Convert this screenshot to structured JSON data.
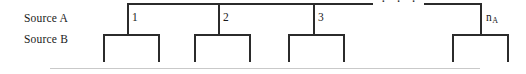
{
  "figure": {
    "row_labels": {
      "source_a": "Source A",
      "source_b": "Source B"
    },
    "ellipsis": "· · ·",
    "colors": {
      "line": "#2b2b2b",
      "rule": "#c9c9c9",
      "text": "#1a1a1a",
      "background": "#ffffff"
    },
    "groups": [
      {
        "caption": "1",
        "caption_sub": ""
      },
      {
        "caption": "2",
        "caption_sub": ""
      },
      {
        "caption": "3",
        "caption_sub": ""
      },
      {
        "caption": "n",
        "caption_sub": "A"
      }
    ]
  }
}
